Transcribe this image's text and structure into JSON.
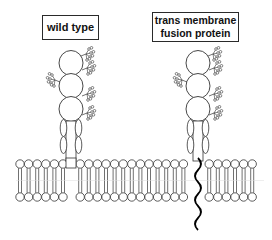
{
  "diagram": {
    "proteins": [
      {
        "id": "wild-type",
        "label_lines": [
          "wild type"
        ],
        "domains": 3,
        "anchor": "membrane-embedded stalk"
      },
      {
        "id": "tm-fusion",
        "label_lines": [
          "trans membrane",
          "fusion protein"
        ],
        "domains": 3,
        "anchor": "transmembrane helix"
      }
    ],
    "membrane": {
      "type": "lipid bilayer"
    },
    "colors": {
      "line": "#333333",
      "tm_helix": "#000000",
      "background": "#ffffff"
    }
  }
}
